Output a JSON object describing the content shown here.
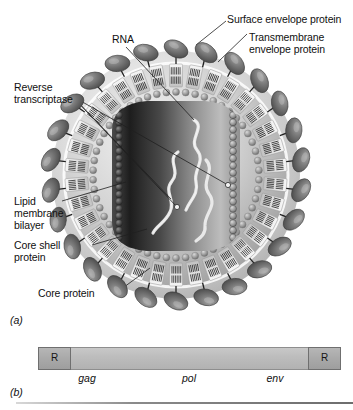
{
  "figure": {
    "panel_a": {
      "id": "(a)",
      "labels": [
        {
          "key": "surface_envelope_protein",
          "text": "Surface envelope protein"
        },
        {
          "key": "transmembrane_envelope_protein_line1",
          "text": "Transmembrane"
        },
        {
          "key": "transmembrane_envelope_protein_line2",
          "text": "envelope protein"
        },
        {
          "key": "rna",
          "text": "RNA"
        },
        {
          "key": "reverse_transcriptase_line1",
          "text": "Reverse"
        },
        {
          "key": "reverse_transcriptase_line2",
          "text": "transcriptase"
        },
        {
          "key": "lipid_membrane_bilayer_line1",
          "text": "Lipid"
        },
        {
          "key": "lipid_membrane_bilayer_line2",
          "text": "membrane"
        },
        {
          "key": "lipid_membrane_bilayer_line3",
          "text": "bilayer"
        },
        {
          "key": "core_shell_protein_line1",
          "text": "Core shell"
        },
        {
          "key": "core_shell_protein_line2",
          "text": "protein"
        },
        {
          "key": "core_protein",
          "text": "Core protein"
        }
      ]
    },
    "panel_b": {
      "id": "(b)",
      "genome_map": {
        "repeat_left_label": "R",
        "repeat_right_label": "R",
        "genes": [
          {
            "name": "gag",
            "center_pct": 18
          },
          {
            "name": "pol",
            "center_pct": 50
          },
          {
            "name": "env",
            "center_pct": 80
          }
        ]
      }
    },
    "colors": {
      "background": "#ffffff",
      "text": "#101010",
      "bar_fill": "#bdbdbd",
      "bar_stroke": "#8e8e8e",
      "repeat_fill": "#a9a9a9",
      "repeat_stroke": "#6f6f6f",
      "envelope_protein": "#6b6b6b",
      "leader_line": "#2b2b2b",
      "core_dark": "#2a2a2a",
      "rna_strand": "#e8e8e8"
    }
  }
}
